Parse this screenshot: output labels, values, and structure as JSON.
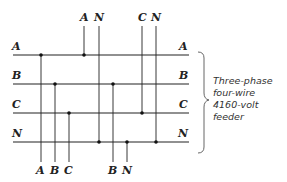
{
  "diagram": {
    "bus_labels_left": [
      "A",
      "B",
      "C",
      "N"
    ],
    "bus_labels_right": [
      "A",
      "B",
      "C",
      "N"
    ],
    "top_tap_labels": [
      "A",
      "N",
      "C",
      "N"
    ],
    "bottom_tap_labels": [
      "A",
      "B",
      "C",
      "B",
      "N"
    ],
    "annotation": {
      "line1": "Three-phase",
      "line2": "four-wire",
      "line3": "4160-volt",
      "line4": "feeder"
    },
    "colors": {
      "line": "#222222",
      "text": "#222222",
      "brace": "#555555"
    }
  }
}
